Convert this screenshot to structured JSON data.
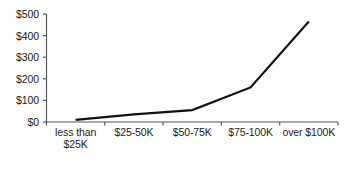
{
  "chart_data": {
    "type": "line",
    "title": "",
    "subtitle": "",
    "xlabel": "",
    "ylabel": "",
    "categories": [
      "less than $25K",
      "$25-50K",
      "$50-75K",
      "$75-100K",
      "over $100K"
    ],
    "values": [
      10,
      35,
      55,
      160,
      465
    ],
    "series": [
      {
        "name": "",
        "values": [
          10,
          35,
          55,
          160,
          465
        ]
      }
    ],
    "ylim": [
      0,
      500
    ],
    "y_ticks": [
      0,
      100,
      200,
      300,
      400,
      500
    ],
    "y_tick_labels": [
      "$0",
      "$100",
      "$200",
      "$300",
      "$400",
      "$500"
    ],
    "grid": false,
    "legend": null,
    "annotations": [],
    "line_color": "#111111",
    "axis_color": "#58595b",
    "background_color": "#ffffff"
  }
}
